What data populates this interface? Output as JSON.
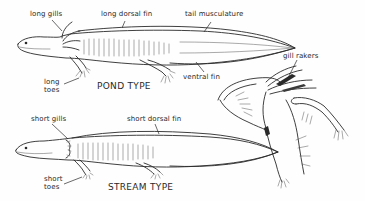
{
  "diagram": {
    "pond": {
      "title": "POND TYPE",
      "labels": {
        "gills": "long gills",
        "dorsal_fin": "long dorsal fin",
        "tail": "tail musculature",
        "ventral_fin": "ventral fin",
        "toes_line1": "long",
        "toes_line2": "toes"
      }
    },
    "stream": {
      "title": "STREAM TYPE",
      "labels": {
        "gills": "short gills",
        "dorsal_fin": "short dorsal fin",
        "toes_line1": "short",
        "toes_line2": "toes"
      }
    },
    "detail": {
      "labels": {
        "gill_rakers": "gill rakers"
      }
    },
    "colors": {
      "ink": "#2a2a2a",
      "background": "#fefefe"
    }
  }
}
